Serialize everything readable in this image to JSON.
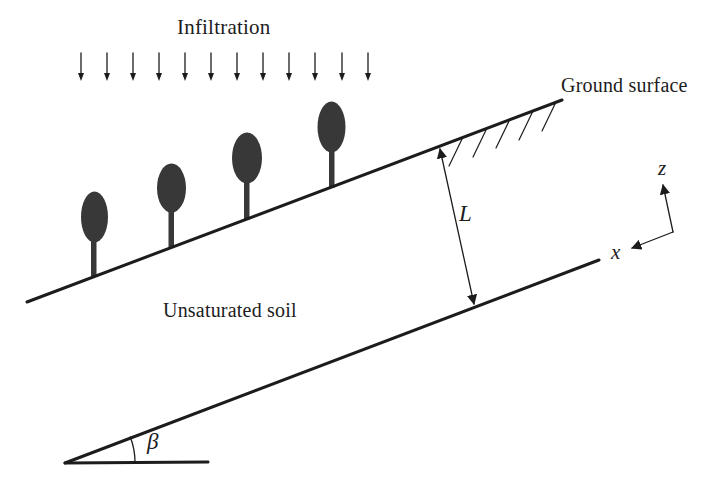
{
  "colors": {
    "bg": "#ffffff",
    "ink": "#1c1c1c",
    "tree": "#383838"
  },
  "labels": {
    "infiltration": "Infiltration",
    "ground_surface": "Ground surface",
    "unsaturated_soil": "Unsaturated soil",
    "depth": "L",
    "z_axis": "z",
    "x_axis": "x",
    "slope_angle": "β"
  },
  "diagram": {
    "infiltration_arrow_count": 12,
    "tree_count": 4,
    "ground_hatch_mark_count": 5,
    "slope_angle_degrees_approx": 21
  }
}
